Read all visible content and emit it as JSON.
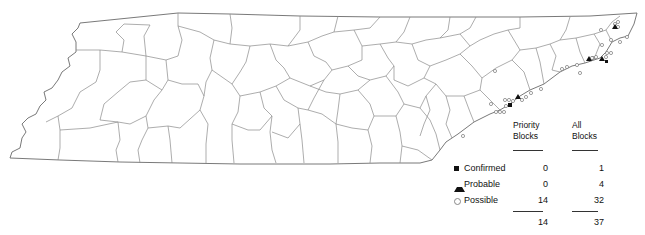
{
  "map": {
    "region": "Tennessee counties",
    "symbol_colors": {
      "confirmed": "#111111",
      "probable": "#111111",
      "possible": "#ffffff"
    }
  },
  "legend": {
    "headers": {
      "priority_line1": "Priority",
      "priority_line2": "Blocks",
      "all_line1": "All",
      "all_line2": "Blocks"
    },
    "rows": [
      {
        "label": "Confirmed",
        "symbol": "square-filled",
        "priority": "0",
        "all": "1"
      },
      {
        "label": "Probable",
        "symbol": "triangle-filled",
        "priority": "0",
        "all": "4"
      },
      {
        "label": "Possible",
        "symbol": "circle-open",
        "priority": "14",
        "all": "32"
      }
    ],
    "totals": {
      "priority": "14",
      "all": "37"
    }
  }
}
